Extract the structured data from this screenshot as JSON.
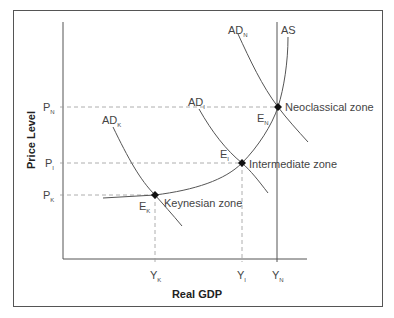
{
  "diagram": {
    "type": "economics-ad-as",
    "axes": {
      "y_label": "Price Level",
      "x_label": "Real GDP"
    },
    "price_ticks": [
      {
        "base": "P",
        "sub": "N"
      },
      {
        "base": "P",
        "sub": "I"
      },
      {
        "base": "P",
        "sub": "K"
      }
    ],
    "gdp_ticks": [
      {
        "base": "Y",
        "sub": "K"
      },
      {
        "base": "Y",
        "sub": "I"
      },
      {
        "base": "Y",
        "sub": "N"
      }
    ],
    "curves": {
      "ad_k": {
        "base": "AD",
        "sub": "K"
      },
      "ad_i": {
        "base": "AD",
        "sub": "I"
      },
      "ad_n": {
        "base": "AD",
        "sub": "N"
      },
      "as": "AS"
    },
    "equilibria": [
      {
        "base": "E",
        "sub": "K",
        "zone": "Keynesian zone"
      },
      {
        "base": "E",
        "sub": "I",
        "zone": "Intermediate zone"
      },
      {
        "base": "E",
        "sub": "N",
        "zone": "Neoclassical zone"
      }
    ],
    "colors": {
      "line": "#555555",
      "dash": "#999999",
      "text": "#444444",
      "point": "#111111"
    }
  }
}
